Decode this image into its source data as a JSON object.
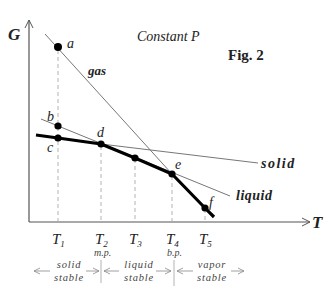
{
  "figure": {
    "title": "Fig. 2",
    "condition": "Constant P",
    "y_axis_label": "G",
    "x_axis_label": "T"
  },
  "curves": {
    "gas": "gas",
    "solid": "solid",
    "liquid": "liquid"
  },
  "points": [
    {
      "id": "a",
      "label": "a"
    },
    {
      "id": "b",
      "label": "b"
    },
    {
      "id": "c",
      "label": "c"
    },
    {
      "id": "d",
      "label": "d"
    },
    {
      "id": "t3",
      "label": ""
    },
    {
      "id": "e",
      "label": "e"
    },
    {
      "id": "f",
      "label": "f"
    }
  ],
  "temperatures": [
    {
      "id": "T1",
      "base": "T",
      "sub": "1",
      "note": ""
    },
    {
      "id": "T2",
      "base": "T",
      "sub": "2",
      "note": "m.p."
    },
    {
      "id": "T3",
      "base": "T",
      "sub": "3",
      "note": ""
    },
    {
      "id": "T4",
      "base": "T",
      "sub": "4",
      "note": "b.p."
    },
    {
      "id": "T5",
      "base": "T",
      "sub": "5",
      "note": ""
    }
  ],
  "regions": [
    {
      "id": "solid-stable",
      "line1": "solid",
      "line2": "stable"
    },
    {
      "id": "liquid-stable",
      "line1": "liquid",
      "line2": "stable"
    },
    {
      "id": "vapor-stable",
      "line1": "vapor",
      "line2": "stable"
    }
  ],
  "colors": {
    "axis": "#555555",
    "thin_line": "#777777",
    "thick_line": "#000000",
    "dashed": "#aaaaaa",
    "text": "#222222"
  }
}
